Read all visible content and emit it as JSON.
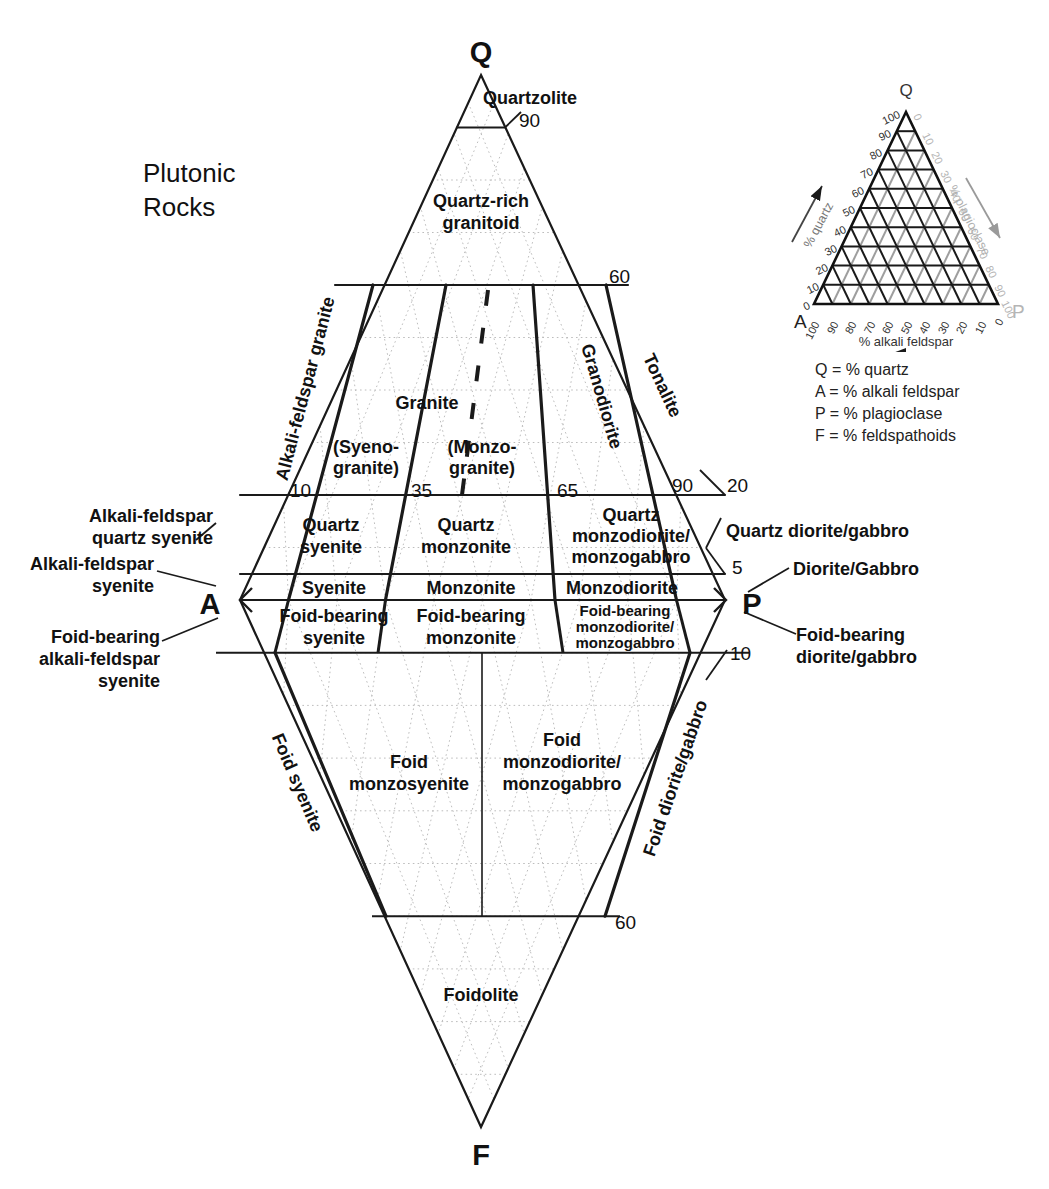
{
  "title": {
    "line1": "Plutonic",
    "line2": "Rocks"
  },
  "vertices": {
    "q": "Q",
    "a": "A",
    "p": "P",
    "f": "F"
  },
  "legend": {
    "items": [
      "Q = % quartz",
      "A = % alkali feldspar",
      "P = % plagioclase",
      "F = % feldspathoids"
    ]
  },
  "inset": {
    "apex_q": "Q",
    "corner_a": "A",
    "corner_p": "P",
    "axis_left_label": "% quartz",
    "axis_right_label": "% plagioclase",
    "axis_bottom_label": "% alkali feldspar",
    "left_ticks": [
      "0",
      "10",
      "20",
      "30",
      "40",
      "50",
      "60",
      "70",
      "80",
      "90",
      "100"
    ],
    "bottom_ticks": [
      "100",
      "90",
      "80",
      "70",
      "60",
      "50",
      "40",
      "30",
      "20",
      "10",
      "0"
    ],
    "right_ticks": [
      "0",
      "10",
      "20",
      "30",
      "40",
      "50",
      "60",
      "70",
      "80",
      "90",
      "100"
    ]
  },
  "fields": {
    "quartzolite": "Quartzolite",
    "quartz_rich_granitoid": [
      "Quartz-rich",
      "granitoid"
    ],
    "alkali_feldspar_granite": "Alkali-feldspar granite",
    "granite": "Granite",
    "syeno_granite": [
      "(Syeno-",
      "granite)"
    ],
    "monzo_granite": [
      "(Monzo-",
      "granite)"
    ],
    "granodiorite": "Granodiorite",
    "tonalite": "Tonalite",
    "quartz_syenite": [
      "Quartz",
      "syenite"
    ],
    "quartz_monzonite": [
      "Quartz",
      "monzonite"
    ],
    "quartz_monzodiorite": [
      "Quartz",
      "monzodiorite/",
      "monzogabbro"
    ],
    "syenite": "Syenite",
    "monzonite": "Monzonite",
    "monzodiorite": "Monzodiorite",
    "foid_bearing_syenite": [
      "Foid-bearing",
      "syenite"
    ],
    "foid_bearing_monzonite": [
      "Foid-bearing",
      "monzonite"
    ],
    "foid_bearing_monzodiorite": [
      "Foid-bearing",
      "monzodiorite/",
      "monzogabbro"
    ],
    "foid_syenite": "Foid syenite",
    "foid_monzosyenite": [
      "Foid",
      "monzosyenite"
    ],
    "foid_monzodiorite": [
      "Foid",
      "monzodiorite/",
      "monzogabbro"
    ],
    "foid_diorite_gabbro": "Foid diorite/gabbro",
    "foidolite": "Foidolite"
  },
  "external_labels": {
    "alkali_feldspar_quartz_syenite": [
      "Alkali-feldspar",
      "quartz syenite"
    ],
    "alkali_feldspar_syenite": [
      "Alkali-feldspar",
      "syenite"
    ],
    "foid_bearing_alkali_feldspar_syenite": [
      "Foid-bearing",
      "alkali-feldspar",
      "syenite"
    ],
    "quartz_diorite_gabbro": "Quartz diorite/gabbro",
    "diorite_gabbro": "Diorite/Gabbro",
    "foid_bearing_diorite_gabbro": [
      "Foid-bearing",
      "diorite/gabbro"
    ]
  },
  "tick_labels": {
    "q90": "90",
    "q60": "60",
    "a10": "10",
    "a35": "35",
    "a65": "65",
    "a90": "90",
    "p20": "20",
    "p5": "5",
    "p10": "10",
    "f60": "60"
  },
  "colors": {
    "line": "#1a1a1a",
    "grid_dotted": "#b8b8b8",
    "inset_grid_gray": "#9a9a9a",
    "background": "#ffffff"
  }
}
